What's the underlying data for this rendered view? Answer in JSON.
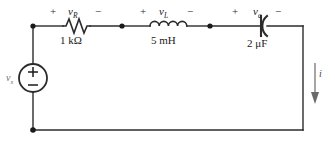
{
  "figure": {
    "type": "circuit-schematic",
    "wire_color": "#2b2b2b",
    "text_color": "#1a1a1a"
  },
  "source": {
    "symbol": "independent-voltage-source",
    "label": "v",
    "label_sub": "s",
    "plus": "+",
    "minus": "−"
  },
  "resistor": {
    "name": "resistor",
    "value": "1 kΩ",
    "polarity_plus": "+",
    "polarity_minus": "−",
    "voltage": "v",
    "voltage_sub": "R"
  },
  "inductor": {
    "name": "inductor",
    "value": "5 mH",
    "polarity_plus": "+",
    "polarity_minus": "−",
    "voltage": "v",
    "voltage_sub": "L"
  },
  "capacitor": {
    "name": "capacitor",
    "value": "2 μF",
    "polarity_plus": "+",
    "polarity_minus": "−",
    "voltage": "v",
    "voltage_sub": "c"
  },
  "current": {
    "label": "i",
    "direction": "down"
  }
}
